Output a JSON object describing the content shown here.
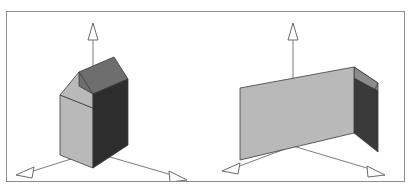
{
  "figure": {
    "title": "",
    "background_color": "#ffffff",
    "frame_color": "#8d8d8d",
    "frame": {
      "x": 6,
      "y": 11,
      "width": 399,
      "height": 171
    },
    "axis_color": "#7d7d7d",
    "arrowhead_fill": "#ffffff",
    "edge_color": "#3a3a3a",
    "panels": [
      {
        "name": "left-panel",
        "label": "",
        "description": "Pentagonal house prism viewed so that the gable end faces the viewer at an angle; three faces visible.",
        "origin": {
          "x": 92,
          "y": 148
        },
        "axes": [
          {
            "name": "z-axis-up",
            "from": {
              "x": 92,
              "y": 148
            },
            "to": {
              "x": 92,
              "y": 25
            },
            "head": "triangle-up"
          },
          {
            "name": "x-axis-left",
            "from": {
              "x": 92,
              "y": 148
            },
            "to": {
              "x": 16,
              "y": 172
            },
            "head": "triangle-left"
          },
          {
            "name": "y-axis-right",
            "from": {
              "x": 92,
              "y": 148
            },
            "to": {
              "x": 182,
              "y": 175
            },
            "head": "triangle-right"
          }
        ],
        "faces": [
          {
            "name": "left-wall-face",
            "color": "#b9b9b9",
            "points": "59,90 92,103 92,163 59,149"
          },
          {
            "name": "left-gable-face",
            "color": "#b9b9b9",
            "points": "59,90 79,68 92,74 92,103"
          },
          {
            "name": "roof-face",
            "color": "#6e6e6e",
            "points": "79,68 113,53 127,74 92,89"
          },
          {
            "name": "front-wall-face",
            "color": "#2d2d2d",
            "points": "92,89 127,74 127,140 92,163"
          },
          {
            "name": "upper-gable-face",
            "color": "#6e6e6e",
            "points": "79,68 92,74 92,89 79,81"
          }
        ]
      },
      {
        "name": "right-panel",
        "label": "",
        "description": "Same pentagonal house prism rotated so the long side wall faces the viewer; gable end seen edge-on at right.",
        "origin": {
          "x": 292,
          "y": 142
        },
        "axes": [
          {
            "name": "z-axis-up",
            "from": {
              "x": 292,
              "y": 142
            },
            "to": {
              "x": 292,
              "y": 25
            },
            "head": "triangle-up"
          },
          {
            "name": "x-axis-left",
            "from": {
              "x": 292,
              "y": 142
            },
            "to": {
              "x": 227,
              "y": 168
            },
            "head": "triangle-left"
          },
          {
            "name": "y-axis-right",
            "from": {
              "x": 292,
              "y": 142
            },
            "to": {
              "x": 383,
              "y": 171
            },
            "head": "triangle-right"
          }
        ],
        "faces": [
          {
            "name": "long-wall-face",
            "color": "#b9b9b9",
            "points": "239,83 353,62 353,128 239,155"
          },
          {
            "name": "roof-slope-face",
            "color": "#8c8c8c",
            "points": "353,62 377,78 377,86 353,73"
          },
          {
            "name": "gable-top-face",
            "color": "#8c8c8c",
            "points": "353,62 377,78 369,94 353,73"
          },
          {
            "name": "right-end-face",
            "color": "#3a3a3a",
            "points": "353,73 377,86 377,147 353,128"
          }
        ]
      }
    ]
  }
}
